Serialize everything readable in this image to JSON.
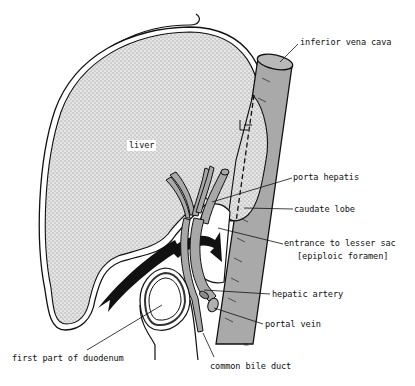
{
  "diagram": {
    "colors": {
      "liver_fill": "#d4d4d4",
      "vessel_fill": "#a8a8a8",
      "ivc_fill": "#a9a9a9",
      "outline": "#111111",
      "background": "#ffffff"
    },
    "labels": {
      "liver": "liver",
      "ivc": "inferior vena cava",
      "porta_hepatis": "porta hepatis",
      "caudate_lobe": "caudate lobe",
      "lesser_sac_1": "entrance to lesser sac",
      "lesser_sac_2": "[epiploic foramen]",
      "hepatic_artery": "hepatic artery",
      "portal_vein": "portal  vein",
      "common_bile_duct": "common bile duct",
      "duodenum": "first part of duodenum",
      "signature": "fd."
    },
    "structures": [
      {
        "name": "liver",
        "shape": "large dotted organ"
      },
      {
        "name": "inferior vena cava",
        "shape": "oblique grey cylinder"
      },
      {
        "name": "caudate lobe",
        "shape": "dotted lobe behind dashed line"
      },
      {
        "name": "porta hepatis",
        "shape": "branching vessels"
      },
      {
        "name": "epiploic foramen",
        "shape": "opening with black arrow"
      },
      {
        "name": "hepatic artery",
        "shape": "small tube"
      },
      {
        "name": "portal vein",
        "shape": "larger tube"
      },
      {
        "name": "common bile duct",
        "shape": "descending tube"
      },
      {
        "name": "first part of duodenum",
        "shape": "ring cross-section"
      }
    ]
  }
}
